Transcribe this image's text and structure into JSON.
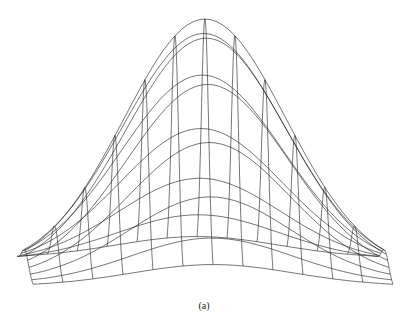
{
  "figure": {
    "type": "wireframe-surface",
    "caption": "(a)",
    "line_color": "#1a1a1a",
    "surface": {
      "function": "gaussian",
      "peak_screen": [
        205,
        19
      ],
      "base_y_center": 272,
      "grid_columns": 13,
      "grid_rows": 13,
      "sigma": 0.45
    }
  }
}
